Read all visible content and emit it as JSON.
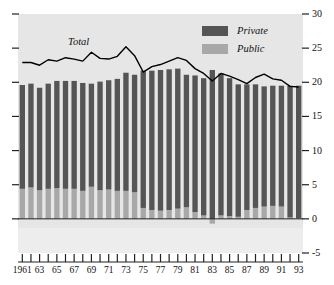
{
  "chart_data": {
    "type": "bar",
    "title": "",
    "subtitle": "",
    "xlabel": "",
    "ylabel": "",
    "ylim": [
      -5,
      30
    ],
    "yticks": [
      -5,
      0,
      5,
      10,
      15,
      20,
      25,
      30
    ],
    "ytick_labels": [
      "-5",
      "0",
      "5",
      "10",
      "15",
      "20",
      "25",
      "30"
    ],
    "y_axis_position": "right",
    "grid": false,
    "legend_position": "top-right",
    "stacked": true,
    "categories": [
      1961,
      1962,
      1963,
      1964,
      1965,
      1966,
      1967,
      1968,
      1969,
      1970,
      1971,
      1972,
      1973,
      1974,
      1975,
      1976,
      1977,
      1978,
      1979,
      1980,
      1981,
      1982,
      1983,
      1984,
      1985,
      1986,
      1987,
      1988,
      1989,
      1990,
      1991,
      1992,
      1993
    ],
    "xtick_labels": [
      "1961",
      "",
      "63",
      "",
      "65",
      "",
      "67",
      "",
      "69",
      "",
      "71",
      "",
      "73",
      "",
      "75",
      "",
      "77",
      "",
      "79",
      "",
      "81",
      "",
      "83",
      "",
      "85",
      "",
      "87",
      "",
      "89",
      "",
      "91",
      "",
      "93"
    ],
    "series": [
      {
        "name": "Public",
        "color": "#a8a8a8",
        "values": [
          4.4,
          4.6,
          4.2,
          4.4,
          4.5,
          4.4,
          4.4,
          4.1,
          4.7,
          4.2,
          4.3,
          4.1,
          4.1,
          3.9,
          1.6,
          1.3,
          1.2,
          1.3,
          1.5,
          1.7,
          1.0,
          0.5,
          -0.7,
          0.5,
          0.4,
          0.3,
          1.3,
          1.6,
          1.8,
          1.9,
          1.8,
          0.2,
          0.1
        ]
      },
      {
        "name": "Private",
        "color": "#555555",
        "values": [
          15.2,
          15.2,
          15.0,
          15.4,
          15.7,
          15.8,
          15.8,
          15.8,
          15.1,
          15.9,
          16.0,
          16.4,
          17.3,
          17.2,
          20.1,
          20.4,
          20.6,
          20.6,
          20.5,
          19.4,
          20.0,
          20.1,
          21.8,
          20.8,
          20.2,
          19.4,
          18.4,
          18.1,
          17.6,
          17.6,
          17.7,
          19.3,
          19.4
        ]
      }
    ],
    "line_series": {
      "name": "Total",
      "label": "Total",
      "color": "#000000",
      "values": [
        22.9,
        22.9,
        22.5,
        23.3,
        23.1,
        23.6,
        23.4,
        23.1,
        24.4,
        23.5,
        23.4,
        23.8,
        25.2,
        23.9,
        21.5,
        22.3,
        22.6,
        23.1,
        23.6,
        23.2,
        22.0,
        21.3,
        20.2,
        21.3,
        20.9,
        20.4,
        19.8,
        20.7,
        21.2,
        20.5,
        20.3,
        19.4,
        19.3
      ]
    },
    "legend": [
      {
        "label": "Private",
        "color": "#555555"
      },
      {
        "label": "Public",
        "color": "#a8a8a8"
      }
    ],
    "annotations": [
      {
        "text": "Total",
        "x": 1966,
        "y": 26.5
      }
    ],
    "colors": {
      "private": "#555555",
      "public": "#a8a8a8",
      "total_line": "#000000",
      "plot_background": "#e6e6e6",
      "page_background": "#ffffff",
      "axis": "#222222"
    }
  }
}
